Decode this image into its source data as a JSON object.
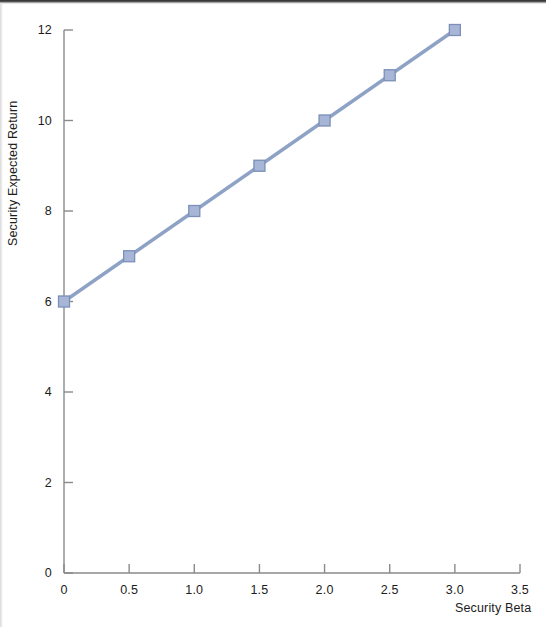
{
  "figure": {
    "background_color": "#ffffff",
    "page_edge_color": "#2e2e2e"
  },
  "chart_data": {
    "type": "line",
    "title": "",
    "subtitle": "",
    "xlabel": "Security Beta",
    "ylabel": "Security Expected Return",
    "x": [
      0,
      0.5,
      1.0,
      1.5,
      2.0,
      2.5,
      3.0
    ],
    "values": [
      6,
      7,
      8,
      9,
      10,
      11,
      12
    ],
    "series": [
      {
        "name": "Security Market Line",
        "x": [
          0,
          0.5,
          1.0,
          1.5,
          2.0,
          2.5,
          3.0
        ],
        "values": [
          6,
          7,
          8,
          9,
          10,
          11,
          12
        ],
        "line_color": "#8ea2c6",
        "marker_color": "#a7b6d6",
        "marker_edge_color": "#7b8fb8",
        "marker": "square"
      }
    ],
    "xlim": [
      0,
      3.5
    ],
    "ylim": [
      0,
      12
    ],
    "xticks": [
      0,
      0.5,
      1.0,
      1.5,
      2.0,
      2.5,
      3.0,
      3.5
    ],
    "xtick_labels": [
      "0",
      "0.5",
      "1.0",
      "1.5",
      "2.0",
      "2.5",
      "3.0",
      "3.5"
    ],
    "yticks": [
      0,
      2,
      4,
      6,
      8,
      10,
      12
    ],
    "ytick_labels": [
      "0",
      "2",
      "4",
      "6",
      "8",
      "10",
      "12"
    ],
    "grid": false,
    "legend": false,
    "legend_position": "none",
    "tick_direction": "in",
    "axis_color": "#8a8a8a",
    "annotations": []
  }
}
